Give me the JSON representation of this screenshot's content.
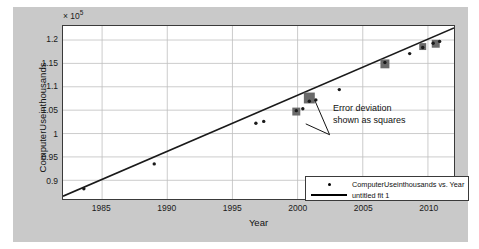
{
  "chart_data": {
    "type": "scatter",
    "title": "",
    "xlabel": "Year",
    "ylabel": "ComputerUseinthousands",
    "y_exponent_label": "× 10",
    "y_exponent_power": "5",
    "xlim": [
      1982,
      2012
    ],
    "ylim": [
      86000,
      123000
    ],
    "xticks": [
      1985,
      1990,
      1995,
      2000,
      2005,
      2010
    ],
    "yticks": [
      0.9,
      0.95,
      1,
      1.05,
      1.1,
      1.15,
      1.2
    ],
    "ytick_labels": [
      "0.9",
      "0.95",
      "1",
      "1.05",
      "1.1",
      "1.15",
      "1.2"
    ],
    "xtick_labels": [
      "1985",
      "1990",
      "1995",
      "2000",
      "2005",
      "2010"
    ],
    "grid": true,
    "legend_position": "lower right",
    "series": [
      {
        "name": "ComputerUseinthousands vs. Year",
        "marker": "dot",
        "points": [
          {
            "x": 1983.6,
            "y": 88200
          },
          {
            "x": 1989.0,
            "y": 93500
          },
          {
            "x": 1996.8,
            "y": 102200
          },
          {
            "x": 1997.4,
            "y": 102600
          },
          {
            "x": 1999.9,
            "y": 104900
          },
          {
            "x": 2000.4,
            "y": 105300
          },
          {
            "x": 2000.9,
            "y": 106900
          },
          {
            "x": 2001.4,
            "y": 107200
          },
          {
            "x": 2003.2,
            "y": 109400
          },
          {
            "x": 2006.7,
            "y": 115200
          },
          {
            "x": 2008.6,
            "y": 117100
          },
          {
            "x": 2009.6,
            "y": 118400
          },
          {
            "x": 2010.4,
            "y": 119300
          },
          {
            "x": 2010.9,
            "y": 119700
          }
        ]
      },
      {
        "name": "untitled fit 1",
        "marker": "line",
        "fit_endpoints": [
          {
            "x": 1982.0,
            "y": 86600
          },
          {
            "x": 2012.0,
            "y": 122600
          }
        ]
      }
    ],
    "error_squares": [
      {
        "x": 1999.9,
        "y": 104700,
        "size": 8
      },
      {
        "x": 2000.9,
        "y": 107600,
        "size": 11
      },
      {
        "x": 2006.7,
        "y": 114900,
        "size": 9
      },
      {
        "x": 2009.6,
        "y": 118600,
        "size": 7
      },
      {
        "x": 2010.6,
        "y": 119200,
        "size": 8
      }
    ],
    "annotations": [
      {
        "text_line1": "Error deviation",
        "text_line2": "shown as squares",
        "points_to": "error squares"
      }
    ],
    "colors": {
      "figure_background": "#c9c9c9",
      "axes_background": "#ffffff",
      "grid": "#bfbfbf",
      "fit_line": "#1a1a1a",
      "marker": "#1a1a1a",
      "error_square": "#6a6a6a",
      "axis_border": "#3a3a3a"
    }
  },
  "legend": {
    "entries": [
      {
        "label": "ComputerUseinthousands vs. Year",
        "key": "dot-marker"
      },
      {
        "label": "untitled fit 1",
        "key": "line-marker"
      }
    ]
  }
}
